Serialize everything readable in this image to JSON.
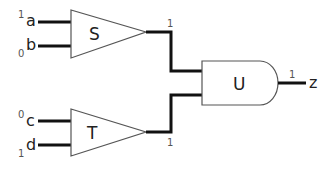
{
  "diagram": {
    "type": "logic-circuit",
    "inputs": [
      {
        "name": "a",
        "value": "1"
      },
      {
        "name": "b",
        "value": "0"
      },
      {
        "name": "c",
        "value": "0"
      },
      {
        "name": "d",
        "value": "1"
      }
    ],
    "gates": [
      {
        "id": "S",
        "label": "S",
        "shape": "triangle",
        "inputs": [
          "a",
          "b"
        ],
        "output_value": "1"
      },
      {
        "id": "T",
        "label": "T",
        "shape": "triangle",
        "inputs": [
          "c",
          "d"
        ],
        "output_value": "1"
      },
      {
        "id": "U",
        "label": "U",
        "shape": "and",
        "inputs": [
          "S",
          "T"
        ],
        "output_value": "1"
      }
    ],
    "output": {
      "name": "z",
      "value": "1"
    }
  }
}
